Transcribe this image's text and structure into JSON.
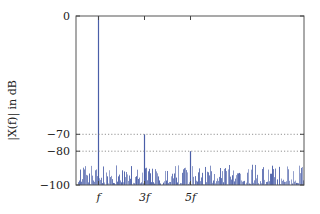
{
  "chart_data": {
    "type": "bar",
    "title": "",
    "xlabel": "",
    "ylabel": "|X(f)| in dB",
    "ylim": [
      -100,
      0
    ],
    "xlim": [
      0,
      9.9
    ],
    "x_unit": "f",
    "yticks": [
      0,
      -70,
      -80,
      -100
    ],
    "ytick_labels": [
      "0",
      "−70",
      "−80",
      "−100"
    ],
    "xticks": [
      1,
      3,
      5
    ],
    "xtick_labels": [
      "f",
      "3f",
      "5f"
    ],
    "grid": {
      "horizontal_dotted_at": [
        -70,
        -80
      ]
    },
    "bar_color": "#4a5ea8",
    "peaks": [
      {
        "label": "f",
        "x": 1,
        "value": 0
      },
      {
        "label": "3f",
        "x": 3,
        "value": -70
      },
      {
        "label": "5f",
        "x": 5,
        "value": -80
      }
    ],
    "noise_floor": {
      "min": -100,
      "max": -88,
      "description": "dense random spectral noise between about -100 and -88 dB across all frequencies"
    }
  },
  "layout": {
    "plot_left": 76,
    "plot_right": 304,
    "plot_top": 16,
    "plot_bottom": 185,
    "px_per_f": 23,
    "x_origin": 75
  }
}
